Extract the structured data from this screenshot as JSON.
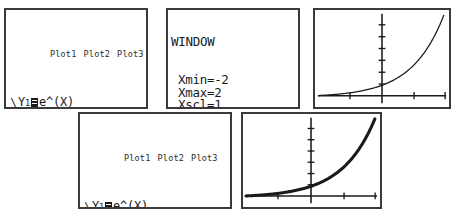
{
  "screens": {
    "y_editor_top": {
      "name": "Y= editor (first)",
      "plot_header": [
        "Plot1",
        "Plot2",
        "Plot3"
      ],
      "rows": [
        {
          "style": "\\",
          "style_thick": false,
          "label": "Y",
          "index": "1",
          "selected": true,
          "expr": "e^(X)"
        },
        {
          "style": "\\",
          "style_thick": false,
          "label": "Y",
          "index": "2",
          "selected": false,
          "expr": ""
        },
        {
          "style": "\\",
          "style_thick": false,
          "label": "Y",
          "index": "3",
          "selected": false,
          "expr": ""
        },
        {
          "style": "\\",
          "style_thick": false,
          "label": "Y",
          "index": "4",
          "selected": false,
          "expr": ""
        },
        {
          "style": "\\",
          "style_thick": false,
          "label": "Y",
          "index": "5",
          "selected": false,
          "expr": ""
        },
        {
          "style": "\\",
          "style_thick": false,
          "label": "Y",
          "index": "6",
          "selected": false,
          "expr": ""
        },
        {
          "style": "\\",
          "style_thick": false,
          "label": "Y",
          "index": "7",
          "selected": false,
          "expr": ""
        }
      ]
    },
    "window": {
      "title": "WINDOW",
      "settings": [
        {
          "key": "Xmin",
          "value": "-2"
        },
        {
          "key": "Xmax",
          "value": "2"
        },
        {
          "key": "Xscl",
          "value": "1"
        },
        {
          "key": "Ymin",
          "value": "-.5"
        },
        {
          "key": "Ymax",
          "value": "7"
        },
        {
          "key": "Yscl",
          "value": "1"
        },
        {
          "key": "Xres",
          "value": "1"
        }
      ]
    },
    "graph_top": {
      "name": "graph of Y1 only",
      "curves": [
        "e^(X)"
      ]
    },
    "y_editor_bottom": {
      "name": "Y= editor (second)",
      "plot_header": [
        "Plot1",
        "Plot2",
        "Plot3"
      ],
      "rows": [
        {
          "style": "\\",
          "style_thick": false,
          "label": "Y",
          "index": "1",
          "selected": true,
          "expr": "e^(X)"
        },
        {
          "style": "\\",
          "style_thick": true,
          "label": "Y",
          "index": "2",
          "selected": true,
          "expr": "nDeriv(Y₁,X,",
          "expr_wrap": "X)"
        },
        {
          "style": "\\",
          "style_thick": false,
          "label": "Y",
          "index": "3",
          "selected": false,
          "expr": ""
        },
        {
          "style": "\\",
          "style_thick": false,
          "label": "Y",
          "index": "4",
          "selected": false,
          "expr": ""
        },
        {
          "style": "\\",
          "style_thick": false,
          "label": "Y",
          "index": "5",
          "selected": false,
          "expr": ""
        },
        {
          "style": "\\",
          "style_thick": false,
          "label": "Y",
          "index": "6",
          "selected": false,
          "expr": ""
        }
      ]
    },
    "graph_bottom": {
      "name": "graph of Y1 and its numerical derivative",
      "curves": [
        "e^(X)",
        "nDeriv(Y1,X,X)"
      ]
    }
  },
  "chart_data": [
    {
      "type": "line",
      "title": "",
      "xlabel": "",
      "ylabel": "",
      "xlim": [
        -2,
        2
      ],
      "ylim": [
        -0.5,
        7
      ],
      "xscl": 1,
      "yscl": 1,
      "grid": false,
      "axes_shown": true,
      "legend": "none",
      "series": [
        {
          "name": "e^(X)",
          "thick": false,
          "x": [
            -2,
            -1.5,
            -1,
            -0.5,
            0,
            0.5,
            1,
            1.5,
            1.9459
          ],
          "y": [
            0.135,
            0.223,
            0.368,
            0.607,
            1.0,
            1.649,
            2.718,
            4.482,
            7.0
          ]
        }
      ]
    },
    {
      "type": "line",
      "title": "",
      "xlabel": "",
      "ylabel": "",
      "xlim": [
        -2,
        2
      ],
      "ylim": [
        -0.5,
        7
      ],
      "xscl": 1,
      "yscl": 1,
      "grid": false,
      "axes_shown": true,
      "legend": "none",
      "series": [
        {
          "name": "e^(X)",
          "thick": false,
          "x": [
            -2,
            -1.5,
            -1,
            -0.5,
            0,
            0.5,
            1,
            1.5,
            1.9459
          ],
          "y": [
            0.135,
            0.223,
            0.368,
            0.607,
            1.0,
            1.649,
            2.718,
            4.482,
            7.0
          ]
        },
        {
          "name": "nDeriv(Y1,X,X)",
          "thick": true,
          "x": [
            -2,
            -1.5,
            -1,
            -0.5,
            0,
            0.5,
            1,
            1.5,
            1.9459
          ],
          "y": [
            0.135,
            0.223,
            0.368,
            0.607,
            1.0,
            1.649,
            2.718,
            4.482,
            7.0
          ]
        }
      ]
    }
  ]
}
